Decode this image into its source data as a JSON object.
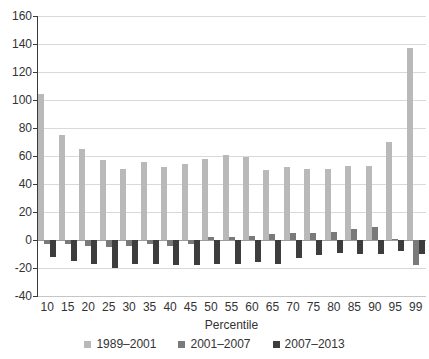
{
  "chart_data": {
    "type": "bar",
    "title": "",
    "xlabel": "Percentile",
    "ylabel": "",
    "ylim": [
      -40,
      160
    ],
    "yticks": [
      160,
      140,
      120,
      100,
      80,
      60,
      40,
      20,
      0,
      -20,
      -40
    ],
    "grid": true,
    "legend_position": "bottom",
    "categories": [
      "10",
      "15",
      "20",
      "25",
      "30",
      "35",
      "40",
      "45",
      "50",
      "55",
      "60",
      "65",
      "70",
      "75",
      "80",
      "85",
      "90",
      "95",
      "99"
    ],
    "series": [
      {
        "name": "1989–2001",
        "color": "#b9b9b9",
        "values": [
          104,
          75,
          65,
          57,
          51,
          56,
          52,
          54,
          58,
          61,
          59,
          50,
          52,
          51,
          51,
          53,
          53,
          70,
          137
        ]
      },
      {
        "name": "2001–2007",
        "color": "#7a7a7a",
        "values": [
          -3,
          -3,
          -4,
          -5,
          -4,
          -3,
          -4,
          -3,
          2,
          2,
          3,
          4,
          5,
          5,
          6,
          8,
          9,
          1,
          -18
        ]
      },
      {
        "name": "2007–2013",
        "color": "#3d3d3d",
        "values": [
          -12,
          -15,
          -17,
          -20,
          -17,
          -17,
          -18,
          -18,
          -17,
          -17,
          -16,
          -17,
          -13,
          -11,
          -9,
          -10,
          -10,
          -8,
          -10
        ]
      }
    ]
  },
  "colors": {
    "background": "#ffffff",
    "gridline": "#d9d9d9",
    "zero_line": "#9c9c9c",
    "axis_spine": "#3a3a3a",
    "tick_text": "#333333"
  }
}
